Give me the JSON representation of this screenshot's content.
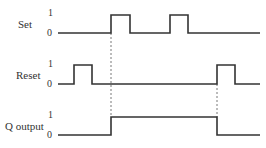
{
  "diagram": {
    "type": "timing-diagram",
    "signals": [
      {
        "name": "Set",
        "high_label": "1",
        "low_label": "0",
        "pulses": [
          [
            111,
            130
          ],
          [
            170,
            188
          ]
        ],
        "baseline_y": 33,
        "high_y": 15
      },
      {
        "name": "Reset",
        "high_label": "1",
        "low_label": "0",
        "pulses": [
          [
            74,
            92
          ],
          [
            217,
            235
          ]
        ],
        "baseline_y": 84,
        "high_y": 65
      },
      {
        "name": "Q output",
        "high_label": "1",
        "low_label": "0",
        "pulses": [
          [
            111,
            217
          ]
        ],
        "baseline_y": 135,
        "high_y": 117
      }
    ],
    "x_start": 58,
    "x_end": 260,
    "dashed_markers": [
      {
        "x": 111,
        "y1": 33,
        "y2": 117
      },
      {
        "x": 217,
        "y1": 84,
        "y2": 117
      }
    ],
    "line_color": "#333333"
  }
}
